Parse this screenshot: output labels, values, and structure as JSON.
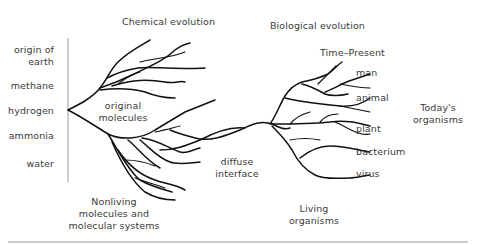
{
  "diagram": {
    "title_left": "Chemical evolution",
    "title_right": "Biological evolution",
    "time_label": "Time–Present",
    "left_labels": [
      "origin of earth",
      "methane",
      "hydrogen",
      "ammonia",
      "water"
    ],
    "left_labels_lines": {
      "origin_line1": "origin of",
      "origin_line2": "earth",
      "methane": "methane",
      "hydrogen": "hydrogen",
      "ammonia": "ammonia",
      "water": "water"
    },
    "center_labels": {
      "original_line1": "original",
      "original_line2": "molecules",
      "diffuse_line1": "diffuse",
      "diffuse_line2": "interface"
    },
    "bottom_labels": {
      "nonliving_line1": "Nonliving",
      "nonliving_line2": "molecules and",
      "nonliving_line3": "molecular systems",
      "living_line1": "Living",
      "living_line2": "organisms"
    },
    "right_labels": [
      "man",
      "animal",
      "plant",
      "bacterium",
      "virus"
    ],
    "right_title": {
      "line1": "Today's",
      "line2": "organisms"
    },
    "colors": {
      "branch": "#111111",
      "text": "#3a3a3a",
      "rule": "#9a9a9a"
    }
  }
}
